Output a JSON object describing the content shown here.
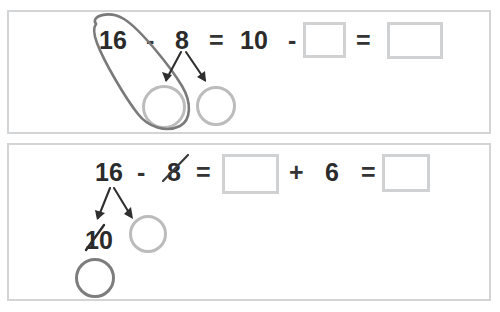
{
  "worksheet": {
    "title": "Make-ten subtraction strategy worksheet",
    "ink_color_dark": "#3a3a3a",
    "ink_color_light": "#bcbcbc",
    "box_border_color": "#cfd1d3",
    "panel_border_color": "#d2d4d6",
    "text_color": "#2b2b2b"
  },
  "problems": [
    {
      "id": "problem-1",
      "equation_tokens": [
        {
          "text": "16",
          "kind": "number",
          "struck": false,
          "lassoed": true
        },
        {
          "text": "-",
          "kind": "operator"
        },
        {
          "text": "8",
          "kind": "number",
          "struck": false
        },
        {
          "text": "=",
          "kind": "operator"
        },
        {
          "text": "10",
          "kind": "number"
        },
        {
          "text": "-",
          "kind": "operator"
        },
        {
          "text": "",
          "kind": "blank-box"
        },
        {
          "text": "=",
          "kind": "operator"
        },
        {
          "text": "",
          "kind": "blank-box"
        }
      ],
      "decomposed_from": "8",
      "parts": [
        {
          "label": "",
          "marker": "circle",
          "shade": "light",
          "lassoed": true
        },
        {
          "label": "",
          "marker": "circle",
          "shade": "light",
          "lassoed": false
        }
      ],
      "annotations": [
        "lasso-oval-around-16-and-first-part",
        "branch-arrow-left",
        "branch-arrow-right"
      ]
    },
    {
      "id": "problem-2",
      "equation_tokens": [
        {
          "text": "16",
          "kind": "number",
          "struck": false
        },
        {
          "text": "-",
          "kind": "operator"
        },
        {
          "text": "8",
          "kind": "number",
          "struck": true
        },
        {
          "text": "=",
          "kind": "operator"
        },
        {
          "text": "",
          "kind": "blank-box"
        },
        {
          "text": "+",
          "kind": "operator"
        },
        {
          "text": "6",
          "kind": "number"
        },
        {
          "text": "=",
          "kind": "operator"
        },
        {
          "text": "",
          "kind": "blank-box"
        }
      ],
      "decomposed_from": "16",
      "parts": [
        {
          "label": "10",
          "marker": "circle",
          "shade": "dark",
          "struck": true
        },
        {
          "label": "",
          "marker": "circle",
          "shade": "light",
          "struck": false
        }
      ],
      "annotations": [
        "strike-through-8",
        "strike-through-10",
        "branch-arrow-left",
        "branch-arrow-right"
      ]
    }
  ],
  "labels": {
    "p1_n16": "16",
    "p1_minus1": "-",
    "p1_n8": "8",
    "p1_eq1": "=",
    "p1_n10": "10",
    "p1_minus2": "-",
    "p1_eq2": "=",
    "p2_n16": "16",
    "p2_minus1": "-",
    "p2_n8": "8",
    "p2_eq1": "=",
    "p2_plus": "+",
    "p2_n6": "6",
    "p2_eq2": "=",
    "p2_part10": "10"
  }
}
